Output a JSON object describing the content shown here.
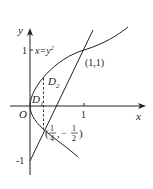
{
  "diagram": {
    "type": "function-graph",
    "axes": {
      "x_label": "x",
      "y_label": "y",
      "origin_label": "O",
      "x_tick": "1",
      "y_tick_pos": "1",
      "y_tick_neg": "-1"
    },
    "curves": [
      {
        "name": "parabola",
        "equation_label": "x=y²",
        "equation_lhs": "x=y",
        "equation_exp": "2"
      },
      {
        "name": "line",
        "equation": "y=2x-1"
      }
    ],
    "points": [
      {
        "label": "(1,1)",
        "x": 1,
        "y": 1
      },
      {
        "label_open": "(",
        "frac1_num": "1",
        "frac1_den": "4",
        "sep": ",",
        "minus": "−",
        "frac2_num": "1",
        "frac2_den": "2",
        "label_close": ")",
        "x": 0.25,
        "y": -0.5
      }
    ],
    "regions": [
      {
        "label": "D",
        "sub": "1"
      },
      {
        "label": "D",
        "sub": "2"
      }
    ],
    "dashed_line_x": 0.25,
    "colors": {
      "stroke": "#222222",
      "background": "#ffffff"
    }
  }
}
